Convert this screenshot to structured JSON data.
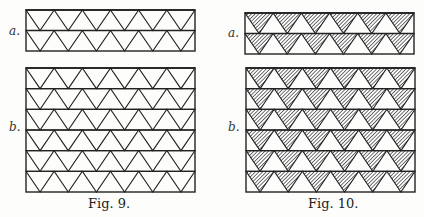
{
  "figures": [
    {
      "id": "fig9",
      "caption": "Fig. 9.",
      "style": "outline",
      "panels": [
        {
          "label": "a.",
          "rows": 2,
          "x": 26,
          "y": 10,
          "w": 169,
          "h": 41
        },
        {
          "label": "b.",
          "rows": 6,
          "x": 26,
          "y": 68,
          "w": 169,
          "h": 124
        }
      ]
    },
    {
      "id": "fig10",
      "caption": "Fig. 10.",
      "style": "hatched",
      "panels": [
        {
          "label": "a.",
          "rows": 2,
          "x": 245,
          "y": 13,
          "w": 169,
          "h": 41
        },
        {
          "label": "b.",
          "rows": 6,
          "x": 246,
          "y": 68,
          "w": 169,
          "h": 124
        }
      ]
    }
  ],
  "triangles_per_row": 6,
  "colors": {
    "ink": "#222222",
    "paper": "#fdfdfb"
  }
}
